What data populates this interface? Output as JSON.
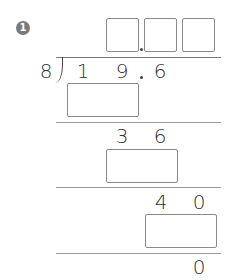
{
  "problem": {
    "number": "1",
    "divisor": "8",
    "dividend": {
      "d1": "1",
      "d2": "9",
      "decimal_point": ".",
      "d3": "6"
    },
    "quotient_boxes": [
      "",
      "",
      ""
    ],
    "quotient_decimal_point": ".",
    "steps": [
      {
        "product_box": "",
        "remainder": [
          "3",
          "6"
        ]
      },
      {
        "product_box": "",
        "remainder": [
          "4",
          "0"
        ]
      },
      {
        "product_box": "",
        "remainder": [
          "0"
        ]
      }
    ]
  }
}
